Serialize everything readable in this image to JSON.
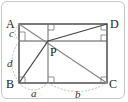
{
  "diagram": {
    "type": "geometry",
    "points": {
      "A": {
        "label": "A",
        "x": 19,
        "y": 24
      },
      "D": {
        "label": "D",
        "x": 107,
        "y": 24
      },
      "B": {
        "label": "B",
        "x": 19,
        "y": 83
      },
      "C": {
        "label": "C",
        "x": 107,
        "y": 83
      },
      "P": {
        "label": "P",
        "x": 48,
        "y": 41
      }
    },
    "segment_labels": {
      "a": "a",
      "b": "b",
      "c": "c",
      "d": "d"
    },
    "colors": {
      "rect": "#333333",
      "diagonal": "#888888",
      "arc": "#aaaaaa",
      "frame": "#c8c8c8"
    }
  }
}
